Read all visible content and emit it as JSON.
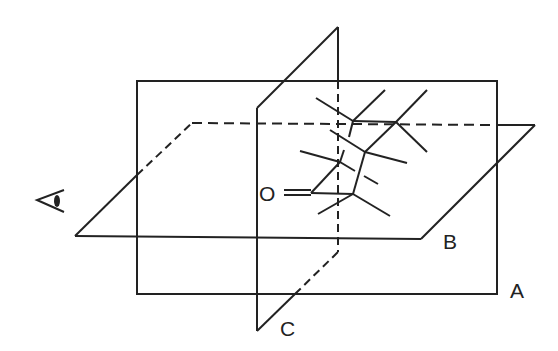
{
  "diagram": {
    "stroke_color": "#222222",
    "labels": {
      "plane_a": "A",
      "plane_b": "B",
      "plane_c": "C",
      "oxygen": "O"
    },
    "icons": {
      "viewer": "eye-icon"
    }
  }
}
